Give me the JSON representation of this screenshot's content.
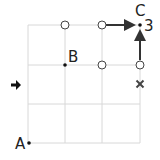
{
  "diagram": {
    "grid": {
      "cols": 3,
      "rows": 3,
      "x": [
        28,
        65,
        102,
        140
      ],
      "y": [
        25,
        65,
        104,
        143
      ],
      "color": "#d8d8d8"
    },
    "points": [
      {
        "label": "A",
        "x": 28,
        "y": 143
      },
      {
        "label": "B",
        "x": 65,
        "y": 65
      },
      {
        "label": "C",
        "x": 140,
        "y": 25
      }
    ],
    "corner_number": "3",
    "open_circles": [
      {
        "x": 65,
        "y": 25
      },
      {
        "x": 102,
        "y": 25
      },
      {
        "x": 102,
        "y": 65
      },
      {
        "x": 140,
        "y": 65
      }
    ],
    "cross_mark": {
      "x": 140,
      "y": 84
    },
    "side_arrow": {
      "x": 16,
      "y": 85,
      "direction": "right"
    },
    "path_arrows": [
      {
        "from": [
          102,
          25
        ],
        "to": [
          138,
          25
        ]
      },
      {
        "from": [
          140,
          65
        ],
        "to": [
          140,
          27
        ]
      }
    ],
    "colors": {
      "line": "#333333",
      "grid": "#d8d8d8",
      "text": "#222222"
    }
  }
}
